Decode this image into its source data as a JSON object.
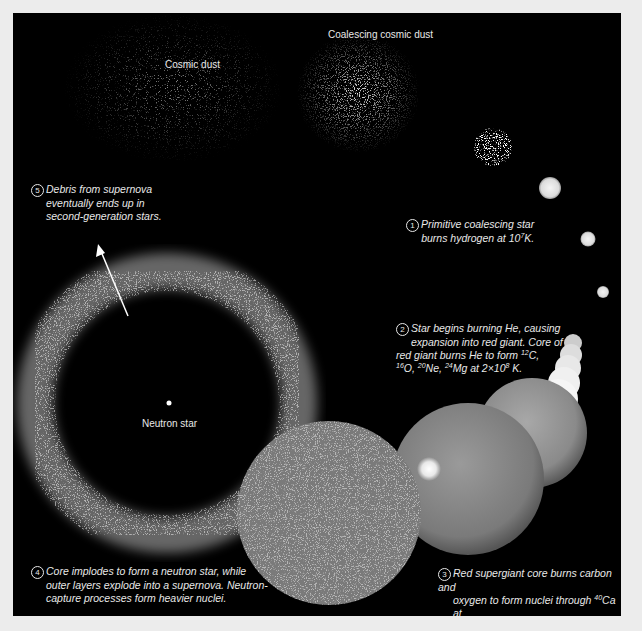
{
  "diagram": {
    "labels": {
      "cosmic_dust": "Cosmic dust",
      "coalescing_dust": "Coalescing cosmic dust",
      "neutron_star": "Neutron star"
    },
    "steps": [
      {
        "number": "1",
        "lines": [
          "Primitive coalescing star",
          "burns hydrogen at 10",
          "7",
          "K."
        ]
      },
      {
        "number": "2",
        "lines": [
          "Star begins burning He, causing",
          "expansion into red giant. Core of",
          "red giant burns He to form ",
          "12",
          "C,",
          "16",
          "O, ",
          "20",
          "Ne, ",
          "24",
          "Mg at 2×10",
          "8",
          " K."
        ]
      },
      {
        "number": "3",
        "lines": [
          "Red supergiant core burns carbon and",
          "oxygen to form nuclei through ",
          "40",
          "Ca at",
          "7×10",
          "8",
          " K. Further heating to 3×10",
          "9",
          " K",
          "forms nuclei through ",
          "56",
          "Fe and ",
          "58",
          "Ni."
        ]
      },
      {
        "number": "4",
        "lines": [
          "Core implodes to form a neutron star, while",
          "outer layers explode into a supernova. Neutron-",
          "capture processes form heavier nuclei."
        ]
      },
      {
        "number": "5",
        "lines": [
          "Debris from supernova",
          "eventually ends up in",
          "second-generation stars."
        ]
      }
    ],
    "colors": {
      "background": "#000000",
      "frame": "#ececec",
      "text": "#e8e8e8"
    }
  }
}
